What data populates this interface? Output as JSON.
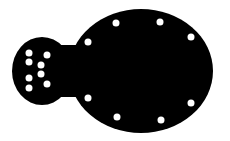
{
  "figure": {
    "colors": {
      "shape": "#000000",
      "holes": "#ffffff",
      "background": "#ffffff"
    },
    "small_lobe_hole_count": 8,
    "large_body_hole_count": 8
  }
}
